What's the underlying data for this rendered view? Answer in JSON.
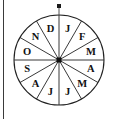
{
  "figure": {
    "name": "month-spinner-wheel",
    "background_color": "#ffffff",
    "border_color": "#3a3a3a",
    "line_color": "#222222",
    "label_color": "#111111",
    "pointer_label": "pointer-dot",
    "hub_label": "center-hub"
  },
  "chart_data": {
    "type": "pie",
    "title": "",
    "xlabel": "",
    "ylabel": "",
    "categories": [
      "J",
      "F",
      "M",
      "A",
      "M",
      "J",
      "J",
      "A",
      "S",
      "O",
      "N",
      "D"
    ],
    "values": [
      1,
      1,
      1,
      1,
      1,
      1,
      1,
      1,
      1,
      1,
      1,
      1
    ],
    "slice_count": 12,
    "slice_angle_degrees": 30,
    "start_angle_degrees": 0,
    "direction": "clockwise",
    "equal_slices": true,
    "legend": "none",
    "grid": false,
    "annotations": [
      "pointer dot at top",
      "square hub at center"
    ]
  },
  "geometry": {
    "center_x": 59,
    "center_y": 60,
    "radius": 45,
    "hub_size": 5,
    "pointer_x": 59,
    "pointer_y": 6,
    "pointer_size": 4,
    "label_radius": 33
  }
}
